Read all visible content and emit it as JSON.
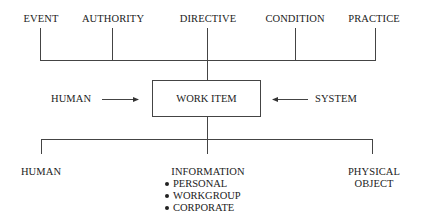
{
  "top_sources": [
    {
      "label": "EVENT"
    },
    {
      "label": "AUTHORITY"
    },
    {
      "label": "DIRECTIVE"
    },
    {
      "label": "CONDITION"
    },
    {
      "label": "PRACTICE"
    }
  ],
  "center": {
    "label": "WORK ITEM"
  },
  "inputs": {
    "left": "HUMAN",
    "right": "SYSTEM"
  },
  "outputs": [
    {
      "label": "HUMAN"
    },
    {
      "label": "INFORMATION",
      "subitems": [
        "PERSONAL",
        "WORKGROUP",
        "CORPORATE"
      ]
    },
    {
      "label_line1": "PHYSICAL",
      "label_line2": "OBJECT"
    }
  ]
}
